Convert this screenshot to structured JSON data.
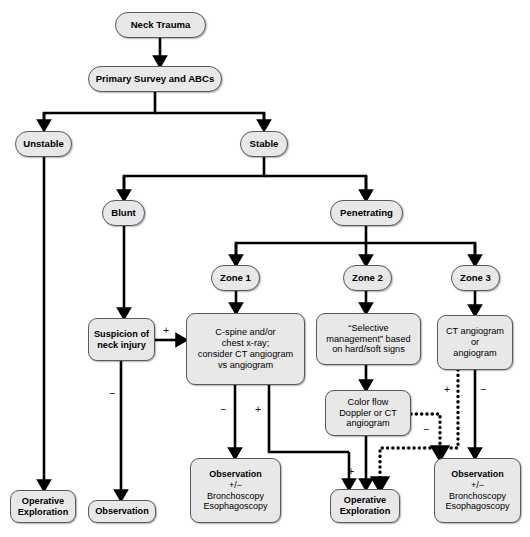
{
  "diagram": {
    "colors": {
      "node_fill": "#e8e8e8",
      "node_stroke": "#5a5a5a",
      "edge": "#000000",
      "background": "#ffffff"
    },
    "nodes": [
      {
        "id": "neck-trauma",
        "label": "Neck Trauma",
        "x": 115,
        "y": 12,
        "w": 91,
        "h": 26,
        "bold": true,
        "pill": true,
        "size": "fs-lg"
      },
      {
        "id": "primary-survey",
        "label": "Primary Survey and ABCs",
        "x": 88,
        "y": 66,
        "w": 134,
        "h": 26,
        "bold": true,
        "pill": true,
        "size": "fs-lg"
      },
      {
        "id": "unstable",
        "label": "Unstable",
        "x": 15,
        "y": 131,
        "w": 57,
        "h": 26,
        "bold": true,
        "pill": true,
        "size": "fs-lg"
      },
      {
        "id": "stable",
        "label": "Stable",
        "x": 240,
        "y": 131,
        "w": 48,
        "h": 26,
        "bold": true,
        "pill": true,
        "size": "fs-lg"
      },
      {
        "id": "blunt",
        "label": "Blunt",
        "x": 102,
        "y": 200,
        "w": 43,
        "h": 26,
        "bold": true,
        "pill": true,
        "size": "fs-lg"
      },
      {
        "id": "penetrating",
        "label": "Penetrating",
        "x": 330,
        "y": 200,
        "w": 73,
        "h": 26,
        "bold": true,
        "pill": true,
        "size": "fs-lg"
      },
      {
        "id": "zone-1",
        "label": "Zone 1",
        "x": 211,
        "y": 265,
        "w": 49,
        "h": 26,
        "bold": true,
        "pill": true,
        "size": "fs-lg"
      },
      {
        "id": "zone-2",
        "label": "Zone 2",
        "x": 343,
        "y": 265,
        "w": 49,
        "h": 26,
        "bold": true,
        "pill": true,
        "size": "fs-lg"
      },
      {
        "id": "zone-3",
        "label": "Zone 3",
        "x": 451,
        "y": 265,
        "w": 49,
        "h": 26,
        "bold": true,
        "pill": true,
        "size": "fs-lg"
      },
      {
        "id": "suspicion-neck-injury",
        "label": "Suspicion of\nneck injury",
        "x": 88,
        "y": 318,
        "w": 67,
        "h": 43,
        "bold": true,
        "pill": false,
        "size": "fs-md"
      },
      {
        "id": "cspine-chest-xray",
        "label": "C-spine and/or\nchest x-ray;\nconsider CT angiogram\nvs angiogram",
        "x": 186,
        "y": 313,
        "w": 119,
        "h": 72,
        "bold": false,
        "pill": false,
        "size": "fs-md"
      },
      {
        "id": "selective-management",
        "label": "“Selective\nmanagement” based\non hard/soft signs",
        "x": 316,
        "y": 313,
        "w": 105,
        "h": 52,
        "bold": false,
        "pill": false,
        "size": "fs-md"
      },
      {
        "id": "ct-angiogram-or",
        "label": "CT angiogram\nor\nangiogram",
        "x": 437,
        "y": 315,
        "w": 76,
        "h": 55,
        "bold": false,
        "pill": false,
        "size": "fs-md"
      },
      {
        "id": "color-flow-doppler",
        "label": "Color flow\nDoppler or CT\nangiogram",
        "x": 325,
        "y": 390,
        "w": 86,
        "h": 46,
        "bold": false,
        "pill": false,
        "size": "fs-md"
      },
      {
        "id": "operative-exploration-left",
        "label": "Operative\nExploration",
        "x": 10,
        "y": 490,
        "w": 66,
        "h": 33,
        "bold": true,
        "pill": false,
        "size": "fs-md"
      },
      {
        "id": "observation-blunt",
        "label": "Observation",
        "x": 88,
        "y": 500,
        "w": 68,
        "h": 23,
        "bold": true,
        "pill": false,
        "size": "fs-md"
      },
      {
        "id": "observation-zone1",
        "label": "Observation\n+/−\nBronchoscopy\nEsophagoscopy",
        "x": 190,
        "y": 458,
        "w": 91,
        "h": 65,
        "bold": false,
        "pill": false,
        "size": "fs-sm"
      },
      {
        "id": "operative-exploration-zone2",
        "label": "Operative\nExploration",
        "x": 330,
        "y": 489,
        "w": 70,
        "h": 34,
        "bold": true,
        "pill": false,
        "size": "fs-md"
      },
      {
        "id": "observation-zone3",
        "label": "Observation\n+/−\nBronchoscopy\nEsophagoscopy",
        "x": 434,
        "y": 458,
        "w": 87,
        "h": 65,
        "bold": false,
        "pill": false,
        "size": "fs-sm"
      }
    ],
    "bold_first_line_nodes": [
      "observation-zone1",
      "observation-zone3"
    ],
    "signs": [
      {
        "id": "sign-suspicion-positive",
        "text": "+",
        "x": 163,
        "y": 325
      },
      {
        "id": "sign-suspicion-negative",
        "text": "−",
        "x": 109,
        "y": 388
      },
      {
        "id": "sign-cspine-negative",
        "text": "−",
        "x": 220,
        "y": 404
      },
      {
        "id": "sign-cspine-positive",
        "text": "+",
        "x": 255,
        "y": 404
      },
      {
        "id": "sign-doppler-positive",
        "text": "+",
        "x": 348,
        "y": 466
      },
      {
        "id": "sign-doppler-negative",
        "text": "−",
        "x": 423,
        "y": 424
      },
      {
        "id": "sign-zone3-positive",
        "text": "+",
        "x": 444,
        "y": 384
      },
      {
        "id": "sign-zone3-negative",
        "text": "−",
        "x": 480,
        "y": 384
      }
    ],
    "edges": [
      {
        "id": "edge-neck-trauma-to-primary-survey",
        "style": "solid",
        "arrow": true,
        "points": "160,38 160,62"
      },
      {
        "id": "edge-primary-survey-split",
        "style": "solid",
        "arrow": false,
        "points": "155,92 155,113 44,113 44,124"
      },
      {
        "id": "edge-primary-survey-to-unstable",
        "style": "solid",
        "arrow": true,
        "points": "44,113 44,126"
      },
      {
        "id": "edge-primary-survey-to-stable",
        "style": "solid",
        "arrow": false,
        "points": "155,113 264,113 264,124"
      },
      {
        "id": "edge-primary-survey-stable-arrow",
        "style": "solid",
        "arrow": true,
        "points": "264,113 264,126"
      },
      {
        "id": "edge-unstable-down",
        "style": "solid",
        "arrow": true,
        "points": "44,157 44,486"
      },
      {
        "id": "edge-stable-split-left",
        "style": "solid",
        "arrow": false,
        "points": "264,157 264,176 124,176 124,194"
      },
      {
        "id": "edge-stable-to-blunt",
        "style": "solid",
        "arrow": true,
        "points": "124,176 124,196"
      },
      {
        "id": "edge-stable-to-penetrating",
        "style": "solid",
        "arrow": false,
        "points": "264,176 366,176 366,194"
      },
      {
        "id": "edge-stable-penetrating-arrow",
        "style": "solid",
        "arrow": true,
        "points": "366,176 366,196"
      },
      {
        "id": "edge-blunt-to-suspicion",
        "style": "solid",
        "arrow": true,
        "points": "124,226 124,314"
      },
      {
        "id": "edge-penetrating-split",
        "style": "solid",
        "arrow": false,
        "points": "366,226 366,243 236,243 236,259"
      },
      {
        "id": "edge-penetrating-to-zone1",
        "style": "solid",
        "arrow": true,
        "points": "236,243 236,261"
      },
      {
        "id": "edge-penetrating-to-zone2",
        "style": "solid",
        "arrow": true,
        "points": "366,243 366,261"
      },
      {
        "id": "edge-penetrating-to-zone3",
        "style": "solid",
        "arrow": false,
        "points": "366,243 475,243 475,259"
      },
      {
        "id": "edge-penetrating-zone3-arrow",
        "style": "solid",
        "arrow": true,
        "points": "475,243 475,261"
      },
      {
        "id": "edge-zone1-to-cspine",
        "style": "solid",
        "arrow": true,
        "points": "236,291 236,309"
      },
      {
        "id": "edge-zone2-to-selective",
        "style": "solid",
        "arrow": true,
        "points": "366,291 366,309"
      },
      {
        "id": "edge-zone3-to-ct-angiogram",
        "style": "solid",
        "arrow": true,
        "points": "475,291 475,311"
      },
      {
        "id": "edge-suspicion-positive-to-cspine",
        "style": "solid",
        "arrow": true,
        "points": "155,340 182,340"
      },
      {
        "id": "edge-suspicion-negative-to-observation",
        "style": "solid",
        "arrow": true,
        "points": "121,361 121,496"
      },
      {
        "id": "edge-cspine-negative-to-observation",
        "style": "solid",
        "arrow": true,
        "points": "235,385 235,454"
      },
      {
        "id": "edge-cspine-positive-to-operative",
        "style": "solid",
        "arrow": false,
        "points": "269,385 269,452 349,452"
      },
      {
        "id": "edge-cspine-positive-operative-arrow",
        "style": "solid",
        "arrow": true,
        "points": "349,452 349,485"
      },
      {
        "id": "edge-selective-to-doppler",
        "style": "solid",
        "arrow": true,
        "points": "366,365 366,386"
      },
      {
        "id": "edge-doppler-positive-to-operative",
        "style": "solid",
        "arrow": true,
        "points": "366,436 366,485"
      },
      {
        "id": "edge-doppler-negative-to-observation",
        "style": "dotted",
        "arrow": true,
        "points": "411,414 440,414 440,454"
      },
      {
        "id": "edge-ct-angiogram-positive-dotted",
        "style": "dotted",
        "arrow": true,
        "points": "458,370 458,448 380,448 380,485"
      },
      {
        "id": "edge-ct-angiogram-negative-to-observation",
        "style": "solid",
        "arrow": true,
        "points": "475,370 475,454"
      }
    ]
  }
}
